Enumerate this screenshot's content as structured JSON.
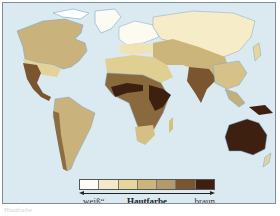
{
  "map": {
    "title": "Hautfarbe",
    "ocean_color": "#dbe9f1",
    "regions": [
      {
        "name": "north-america",
        "shade": 4
      },
      {
        "name": "greenland",
        "shade": 0
      },
      {
        "name": "mexico-central-america",
        "shade": 6
      },
      {
        "name": "south-america",
        "shade": 4
      },
      {
        "name": "south-america-west",
        "shade": 5
      },
      {
        "name": "europe-north",
        "shade": 0
      },
      {
        "name": "europe-south",
        "shade": 2
      },
      {
        "name": "north-africa",
        "shade": 3
      },
      {
        "name": "central-africa",
        "shade": 6
      },
      {
        "name": "sahel-belt",
        "shade": 7
      },
      {
        "name": "east-africa",
        "shade": 7
      },
      {
        "name": "southern-africa",
        "shade": 3
      },
      {
        "name": "siberia",
        "shade": 1
      },
      {
        "name": "central-asia",
        "shade": 3
      },
      {
        "name": "india",
        "shade": 6
      },
      {
        "name": "south-east-asia",
        "shade": 3
      },
      {
        "name": "australia",
        "shade": 7
      },
      {
        "name": "new-guinea",
        "shade": 7
      }
    ]
  },
  "legend": {
    "colors": [
      "#fdfdf8",
      "#f4ebc6",
      "#e6d69a",
      "#cbb57a",
      "#b39a68",
      "#7a5530",
      "#3e2010"
    ],
    "label_left": "„weiß“",
    "label_center": "Hautfarbe",
    "label_right": "braun"
  },
  "caption": "Hautfarbe"
}
